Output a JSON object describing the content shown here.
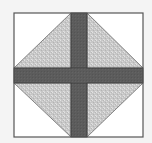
{
  "diagram": {
    "title": "",
    "type": "quilt-block",
    "colors": {
      "page_background": "#f4f4f4",
      "block_background": "#ffffff",
      "border": "#555555",
      "triangle_fill": "#c9c9c9",
      "triangle_speckle": "#dedede",
      "strip_fill": "#5c5c5c",
      "strip_edge": "#3a3a3a"
    },
    "block": {
      "x": 14,
      "y": 13,
      "width": 129,
      "height": 124
    },
    "vertical_strip": {
      "x": 71,
      "width": 16
    },
    "horizontal_strip": {
      "y": 68,
      "height": 15
    },
    "pieces": [
      {
        "name": "top-left-triangle",
        "fill": "speckled-gray"
      },
      {
        "name": "top-right-triangle",
        "fill": "speckled-gray"
      },
      {
        "name": "bottom-left-triangle",
        "fill": "speckled-gray"
      },
      {
        "name": "bottom-right-triangle",
        "fill": "speckled-gray"
      },
      {
        "name": "vertical-strip",
        "fill": "dark-gray"
      },
      {
        "name": "horizontal-strip",
        "fill": "dark-gray"
      }
    ]
  }
}
